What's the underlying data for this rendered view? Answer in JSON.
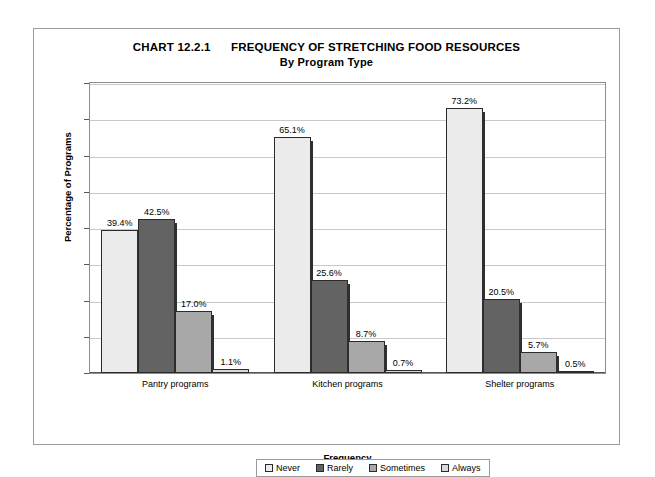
{
  "chart_data": {
    "type": "bar",
    "title": "CHART 12.2.1      FREQUENCY OF STRETCHING FOOD RESOURCES",
    "subtitle": "By Program Type",
    "xlabel": "Frequency",
    "ylabel": "Percentage of Programs",
    "ylim": [
      0,
      80
    ],
    "ytick_labels": [
      "80.0%",
      "70.0%",
      "60.0%",
      "50.0%",
      "40.0%",
      "30.0%",
      "20.0%",
      "10.0%",
      "0.0%"
    ],
    "ytick_values": [
      80,
      70,
      60,
      50,
      40,
      30,
      20,
      10,
      0
    ],
    "grid": true,
    "legend_position": "bottom",
    "categories": [
      "Pantry programs",
      "Kitchen programs",
      "Shelter programs"
    ],
    "series": [
      {
        "name": "Never",
        "color": "#ebebeb",
        "values": [
          39.4,
          65.1,
          73.2
        ],
        "labels": [
          "39.4%",
          "65.1%",
          "73.2%"
        ]
      },
      {
        "name": "Rarely",
        "color": "#636363",
        "values": [
          42.5,
          25.6,
          20.5
        ],
        "labels": [
          "42.5%",
          "25.6%",
          "20.5%"
        ]
      },
      {
        "name": "Sometimes",
        "color": "#a8a8a8",
        "values": [
          17.0,
          8.7,
          5.7
        ],
        "labels": [
          "17.0%",
          "8.7%",
          "5.7%"
        ]
      },
      {
        "name": "Always",
        "color": "#d9d9d9",
        "values": [
          1.1,
          0.7,
          0.5
        ],
        "labels": [
          "1.1%",
          "0.7%",
          "0.5%"
        ]
      }
    ]
  },
  "legend": {
    "items": [
      {
        "label": "Never",
        "swatch": "#ebebeb"
      },
      {
        "label": "Rarely",
        "swatch": "#636363"
      },
      {
        "label": "Sometimes",
        "swatch": "#a8a8a8"
      },
      {
        "label": "Always",
        "swatch": "#d9d9d9"
      }
    ]
  }
}
